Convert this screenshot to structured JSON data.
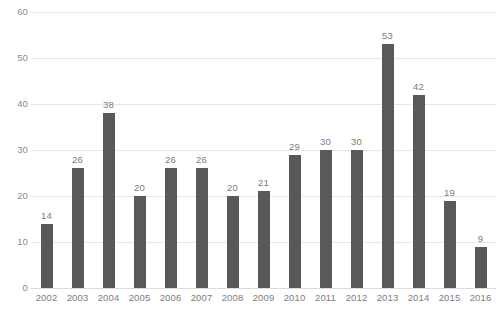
{
  "chart_data": {
    "type": "bar",
    "title": "",
    "subtitle": "",
    "xlabel": "",
    "ylabel": "",
    "categories": [
      "2002",
      "2003",
      "2004",
      "2005",
      "2006",
      "2007",
      "2008",
      "2009",
      "2010",
      "2011",
      "2012",
      "2013",
      "2014",
      "2015",
      "2016"
    ],
    "values": [
      14,
      26,
      38,
      20,
      26,
      26,
      20,
      21,
      29,
      30,
      30,
      53,
      42,
      19,
      9
    ],
    "data_labels": [
      "14",
      "26",
      "38",
      "20",
      "26",
      "26",
      "20",
      "21",
      "29",
      "30",
      "30",
      "53",
      "42",
      "19",
      "9"
    ],
    "ylim": [
      0,
      60
    ],
    "y_ticks": [
      0,
      10,
      20,
      30,
      40,
      50,
      60
    ],
    "y_tick_labels": [
      "0",
      "10",
      "20",
      "30",
      "40",
      "50",
      "60"
    ],
    "grid": true,
    "grid_axis": "y",
    "legend": null,
    "legend_position": "none",
    "series": [
      {
        "name": "",
        "values": [
          14,
          26,
          38,
          20,
          26,
          26,
          20,
          21,
          29,
          30,
          30,
          53,
          42,
          19,
          9
        ]
      }
    ]
  },
  "style": {
    "bar_color": "#595959",
    "grid_color": "#e6e6e6",
    "baseline_color": "#dcdcdc",
    "label_color": "#7c7c7c",
    "tick_color": "#8a8a8a",
    "background": "#ffffff"
  }
}
